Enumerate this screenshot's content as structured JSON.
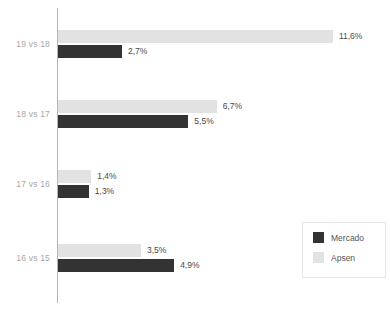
{
  "chart_data": {
    "type": "bar",
    "orientation": "horizontal",
    "title": "",
    "subtitle": "",
    "xlabel": "",
    "ylabel": "",
    "grid": false,
    "xlim": [
      0,
      11.6
    ],
    "value_suffix": "%",
    "decimal_separator": ",",
    "categories": [
      "19 vs 18",
      "18 vs 17",
      "17 vs 16",
      "16 vs 15"
    ],
    "series": [
      {
        "name": "Mercado",
        "color": "#333333",
        "values": [
          2.7,
          5.5,
          1.3,
          4.9
        ],
        "labels": [
          "2,7%",
          "5,5%",
          "1,3%",
          "4,9%"
        ]
      },
      {
        "name": "Apsen",
        "color": "#e2e2e2",
        "values": [
          11.6,
          6.7,
          1.4,
          3.5
        ],
        "labels": [
          "11,6%",
          "6,7%",
          "1,4%",
          "3,5%"
        ]
      }
    ],
    "legend": {
      "position": "bottom-right",
      "entries": [
        {
          "label": "Mercado",
          "color": "#333333"
        },
        {
          "label": "Apsen",
          "color": "#e2e2e2"
        }
      ]
    },
    "axis": {
      "color": "#b4b4b4",
      "label_color": "#a8a8a8"
    }
  },
  "groups": [
    {
      "category": "19 vs 18",
      "apsen": {
        "label": "11,6%",
        "value": 11.6
      },
      "mercado": {
        "label": "2,7%",
        "value": 2.7
      }
    },
    {
      "category": "18 vs 17",
      "apsen": {
        "label": "6,7%",
        "value": 6.7
      },
      "mercado": {
        "label": "5,5%",
        "value": 5.5
      }
    },
    {
      "category": "17 vs 16",
      "apsen": {
        "label": "1,4%",
        "value": 1.4
      },
      "mercado": {
        "label": "1,3%",
        "value": 1.3
      }
    },
    {
      "category": "16 vs 15",
      "apsen": {
        "label": "3,5%",
        "value": 3.5
      },
      "mercado": {
        "label": "4,9%",
        "value": 4.9
      }
    }
  ],
  "legend": {
    "mercado_label": "Mercado",
    "apsen_label": "Apsen"
  }
}
